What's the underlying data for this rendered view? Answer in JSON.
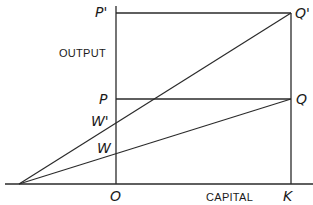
{
  "diagram": {
    "axis_labels": {
      "vertical": "OUTPUT",
      "horizontal": "CAPITAL"
    },
    "points": {
      "origin": "O",
      "capital": "K",
      "p_prime": "P'",
      "p": "P",
      "q_prime": "Q'",
      "q": "Q",
      "w_prime": "W'",
      "w": "W"
    },
    "colors": {
      "line": "#2a2a2a",
      "text": "#1a1a1a",
      "background": "#ffffff"
    },
    "geometry": {
      "ray_origin": [
        19,
        184
      ],
      "O": [
        116,
        184
      ],
      "K": [
        291,
        184
      ],
      "P_prime": [
        116,
        13
      ],
      "Q_prime": [
        291,
        13
      ],
      "P": [
        116,
        99
      ],
      "Q": [
        291,
        99
      ],
      "W_prime": [
        116,
        123
      ],
      "W": [
        116,
        153
      ]
    }
  }
}
